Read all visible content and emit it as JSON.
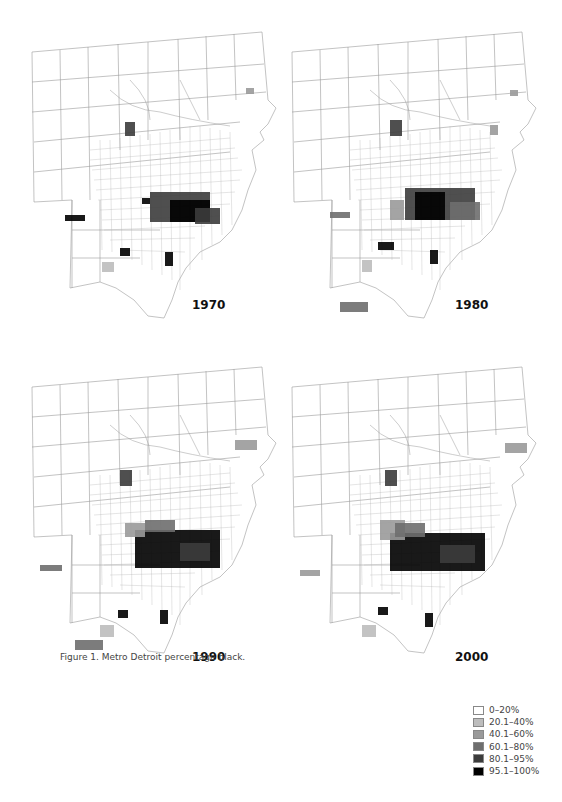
{
  "figure": {
    "caption": "Figure 1. Metro Detroit percentage black."
  },
  "maps": [
    {
      "year": "1970"
    },
    {
      "year": "1980"
    },
    {
      "year": "1990"
    },
    {
      "year": "2000"
    }
  ],
  "legend": {
    "items": [
      {
        "label": "0–20%",
        "color": "#ffffff"
      },
      {
        "label": "20.1–40%",
        "color": "#bdbdbd"
      },
      {
        "label": "40.1–60%",
        "color": "#9a9a9a"
      },
      {
        "label": "60.1–80%",
        "color": "#6e6e6e"
      },
      {
        "label": "80.1–95%",
        "color": "#3c3c3c"
      },
      {
        "label": "95.1–100%",
        "color": "#000000"
      }
    ]
  }
}
